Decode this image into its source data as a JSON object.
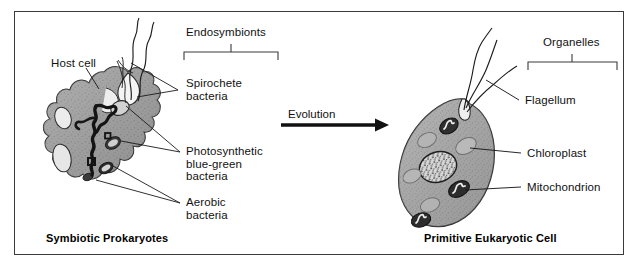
{
  "figure": {
    "title_left": "Symbiotic Prokaryotes",
    "title_right": "Primitive Eukaryotic Cell",
    "transition_label": "Evolution",
    "frame_color": "#3a3a3a",
    "background": "#ffffff",
    "cell_fill": "#9a9a9a",
    "ink": "#111111"
  },
  "left_panel": {
    "labels": {
      "host_cell": "Host cell",
      "endosymbionts": "Endosymbionts",
      "spirochete": "Spirochete\nbacteria",
      "photosynthetic": "Photosynthetic\nblue-green\nbacteria",
      "aerobic": "Aerobic\nbacteria"
    }
  },
  "right_panel": {
    "labels": {
      "organelles": "Organelles",
      "flagellum": "Flagellum",
      "chloroplast": "Chloroplast",
      "mitochondrion": "Mitochondrion"
    }
  }
}
